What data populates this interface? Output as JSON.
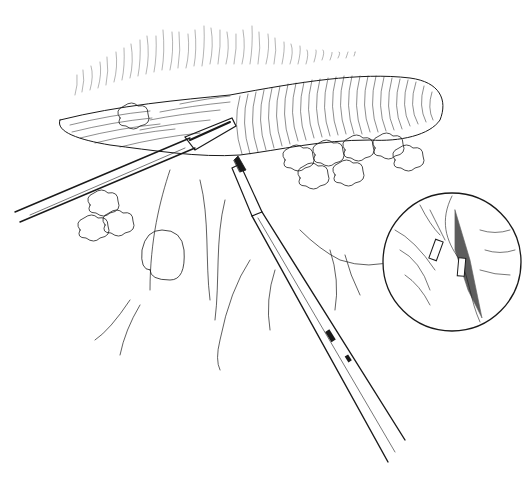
{
  "illustration": {
    "type": "line-art medical illustration",
    "subject": "two laparoscopic instruments (grasper and clip applier) at tissue with inset magnified view of applied clips",
    "colors": {
      "ink": "#1a1a1a",
      "background": "#ffffff"
    },
    "inset": {
      "shape": "circle",
      "center": [
        452,
        262
      ],
      "radius": 69
    }
  }
}
